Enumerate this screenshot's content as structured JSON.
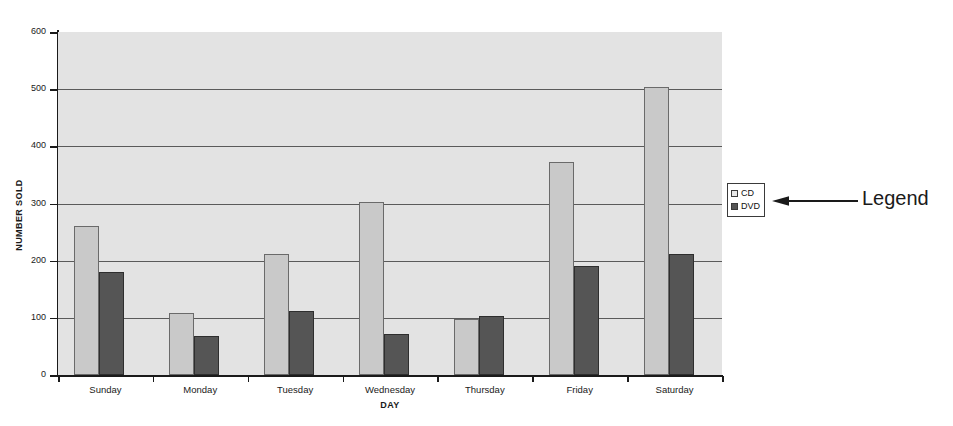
{
  "chart_data": {
    "type": "bar",
    "title": "",
    "xlabel": "DAY",
    "ylabel": "NUMBER SOLD",
    "categories": [
      "Sunday",
      "Monday",
      "Tuesday",
      "Wednesday",
      "Thursday",
      "Friday",
      "Saturday"
    ],
    "series": [
      {
        "name": "CD",
        "values": [
          260,
          108,
          212,
          302,
          98,
          372,
          503
        ],
        "color": "#c9c9c9"
      },
      {
        "name": "DVD",
        "values": [
          180,
          68,
          112,
          72,
          104,
          190,
          212
        ],
        "color": "#555555"
      }
    ],
    "ylim": [
      0,
      600
    ],
    "yticks": [
      0,
      100,
      200,
      300,
      400,
      500,
      600
    ],
    "grid": true,
    "legend_position": "right",
    "plot_background": "#e3e3e3"
  },
  "legend": {
    "entries": [
      {
        "label": "CD"
      },
      {
        "label": "DVD"
      }
    ]
  },
  "annotation": {
    "label": "Legend",
    "arrow_icon": "left-arrow-icon"
  }
}
